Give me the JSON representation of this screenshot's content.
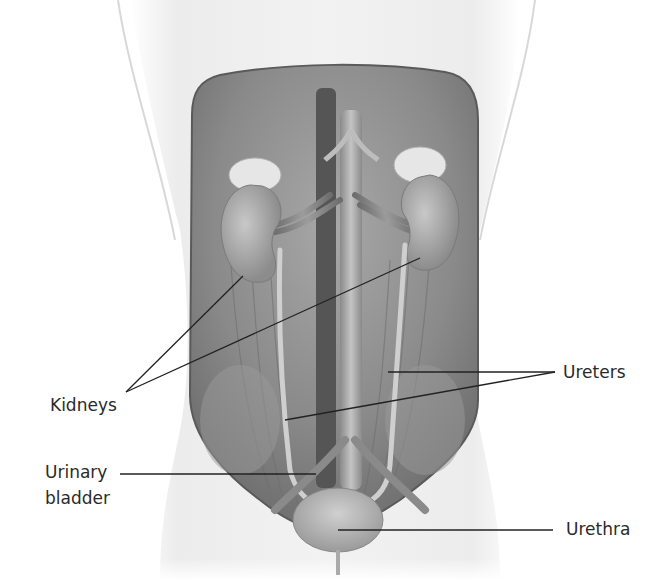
{
  "diagram": {
    "labels": {
      "kidneys": "Kidneys",
      "ureters": "Ureters",
      "urinary_bladder_line1": "Urinary",
      "urinary_bladder_line2": "bladder",
      "urethra": "Urethra"
    },
    "colors": {
      "background": "#ffffff",
      "body_outline": "#e6e6e6",
      "cavity": "#7a7a7a",
      "organ": "#b5b5b5",
      "leader_line": "#222222",
      "text": "#2a2a2a"
    }
  }
}
